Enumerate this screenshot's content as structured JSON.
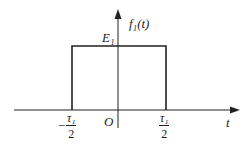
{
  "diagram": {
    "type": "rectangular-pulse",
    "y_axis_label": "f₁(t)",
    "x_axis_label": "t",
    "origin_label": "O",
    "amplitude_label": "E₁",
    "left_edge": {
      "sign": "−",
      "numerator": "τ₁",
      "denominator": "2"
    },
    "right_edge": {
      "numerator": "τ₁",
      "denominator": "2"
    },
    "colors": {
      "line": "#222222",
      "background": "#ffffff"
    }
  }
}
